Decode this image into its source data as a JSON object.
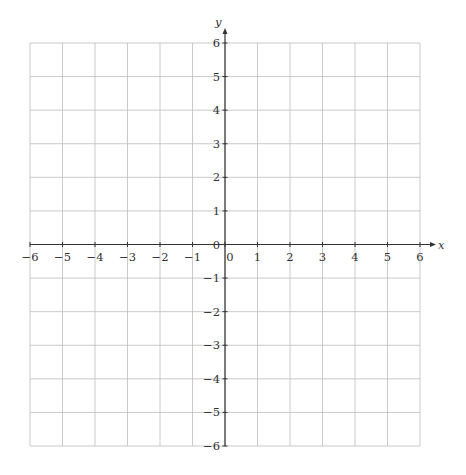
{
  "chart_data": {
    "type": "line",
    "title": "",
    "xlabel": "x",
    "ylabel": "y",
    "xlim": [
      -6,
      6
    ],
    "ylim": [
      -6,
      6
    ],
    "grid": true,
    "x_ticks": [
      -6,
      -5,
      -4,
      -3,
      -2,
      -1,
      0,
      1,
      2,
      3,
      4,
      5,
      6
    ],
    "y_ticks": [
      -6,
      -5,
      -4,
      -3,
      -2,
      -1,
      0,
      1,
      2,
      3,
      4,
      5,
      6
    ],
    "x_tick_labels": [
      "−6",
      "−5",
      "−4",
      "−3",
      "−2",
      "−1",
      "0",
      "1",
      "2",
      "3",
      "4",
      "5",
      "6"
    ],
    "y_tick_labels": [
      "−6",
      "−5",
      "−4",
      "−3",
      "−2",
      "−1",
      "0",
      "1",
      "2",
      "3",
      "4",
      "5",
      "6"
    ],
    "series": [],
    "legend": null
  },
  "colors": {
    "grid": "#bdbdbd",
    "axis": "#333333",
    "background": "#ffffff"
  }
}
